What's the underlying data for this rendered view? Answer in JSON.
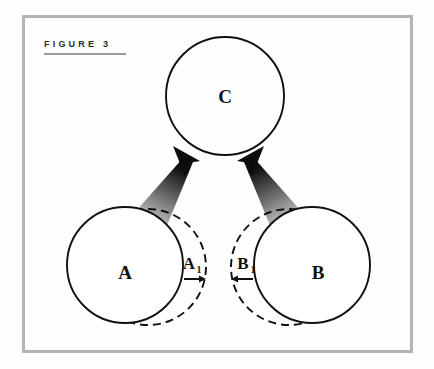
{
  "figure": {
    "label": "FIGURE 3",
    "frame_color": "#b4b4b4",
    "background_color": "#fefefe",
    "rule_color": "#9a9a9a"
  },
  "diagram": {
    "type": "concept-merge-diagram",
    "stroke_color": "#111111",
    "arrow_gradient_from": "#d6d6d6",
    "arrow_gradient_to": "#0d0d0d",
    "nodes": [
      {
        "id": "C",
        "label": "C",
        "shape": "circle",
        "style": "solid",
        "cx": 225,
        "cy": 96,
        "r": 59
      },
      {
        "id": "A",
        "label": "A",
        "shape": "circle",
        "style": "solid",
        "cx": 125,
        "cy": 265,
        "r": 58
      },
      {
        "id": "B",
        "label": "B",
        "shape": "circle",
        "style": "solid",
        "cx": 312,
        "cy": 265,
        "r": 58
      },
      {
        "id": "A1",
        "label": "A",
        "sublabel": "1",
        "shape": "circle",
        "style": "dashed",
        "cx": 148,
        "cy": 267,
        "r": 58
      },
      {
        "id": "B1",
        "label": "B",
        "sublabel": "1",
        "shape": "circle",
        "style": "dashed",
        "cx": 289,
        "cy": 267,
        "r": 58
      }
    ],
    "shift_arrows": [
      {
        "id": "A1-shift",
        "direction": "right",
        "x1": 186,
        "x2": 205,
        "y": 279
      },
      {
        "id": "B1-shift",
        "direction": "left",
        "x1": 251,
        "x2": 232,
        "y": 279
      }
    ],
    "flow_arrows": [
      {
        "id": "A-to-C",
        "from": "A1",
        "to": "C",
        "direction": "up-right"
      },
      {
        "id": "B-to-C",
        "from": "B1",
        "to": "C",
        "direction": "up-left"
      }
    ]
  }
}
